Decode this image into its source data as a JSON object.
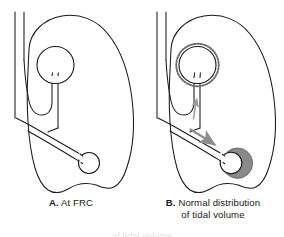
{
  "figure": {
    "type": "medical-illustration",
    "line_color": "#1a1a1a",
    "fill_color": "#ffffff",
    "shade_color": "#8a8a8a",
    "arrow_color": "#9a9a9a",
    "background": "#ffffff"
  },
  "panels": [
    {
      "id": "A",
      "label": "A.",
      "caption": "At FRC",
      "caption_full": "A. At FRC",
      "structures": [
        "lung-outline",
        "trachea",
        "upper-bronchus",
        "upper-alveolus",
        "lower-bronchus",
        "lower-alveolus"
      ],
      "upper_alveolus_state": "resting",
      "lower_alveolus_state": "resting",
      "arrows": []
    },
    {
      "id": "B",
      "label": "B.",
      "caption_line1": "Normal distribution",
      "caption_line2": "of tidal volume",
      "caption_full": "B. Normal distribution of tidal volume",
      "structures": [
        "lung-outline",
        "trachea",
        "upper-bronchus",
        "upper-alveolus-dashed",
        "lower-bronchus",
        "lower-alveolus-shaded",
        "flow-arrow-upper",
        "flow-arrow-lower"
      ],
      "upper_alveolus_state": "dashed-outline-minimal-expansion",
      "lower_alveolus_state": "gray-shaded-expanded",
      "arrows": [
        {
          "name": "flow-arrow-upper",
          "direction": "up",
          "size": "small"
        },
        {
          "name": "flow-arrow-lower",
          "direction": "down-right",
          "size": "large"
        }
      ]
    }
  ],
  "bottom_bleed_text": "of tidal volume"
}
